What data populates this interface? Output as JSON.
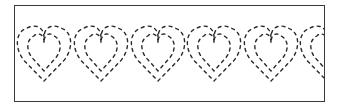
{
  "pattern": {
    "type": "heart-border-stitch",
    "motif": "heart",
    "outline_style": "dashed",
    "outlines_per_heart": 2,
    "visible_heart_count": 6,
    "last_heart_clipped": true,
    "stroke_color": "#2a2a2a",
    "frame_color": "#3a3a3a",
    "background_color": "#ffffff",
    "heart_centers_x": [
      43,
      100,
      157,
      213,
      270,
      326
    ],
    "heart_top_y": 27,
    "heart_tip_y": 80,
    "heart_width": 56
  }
}
